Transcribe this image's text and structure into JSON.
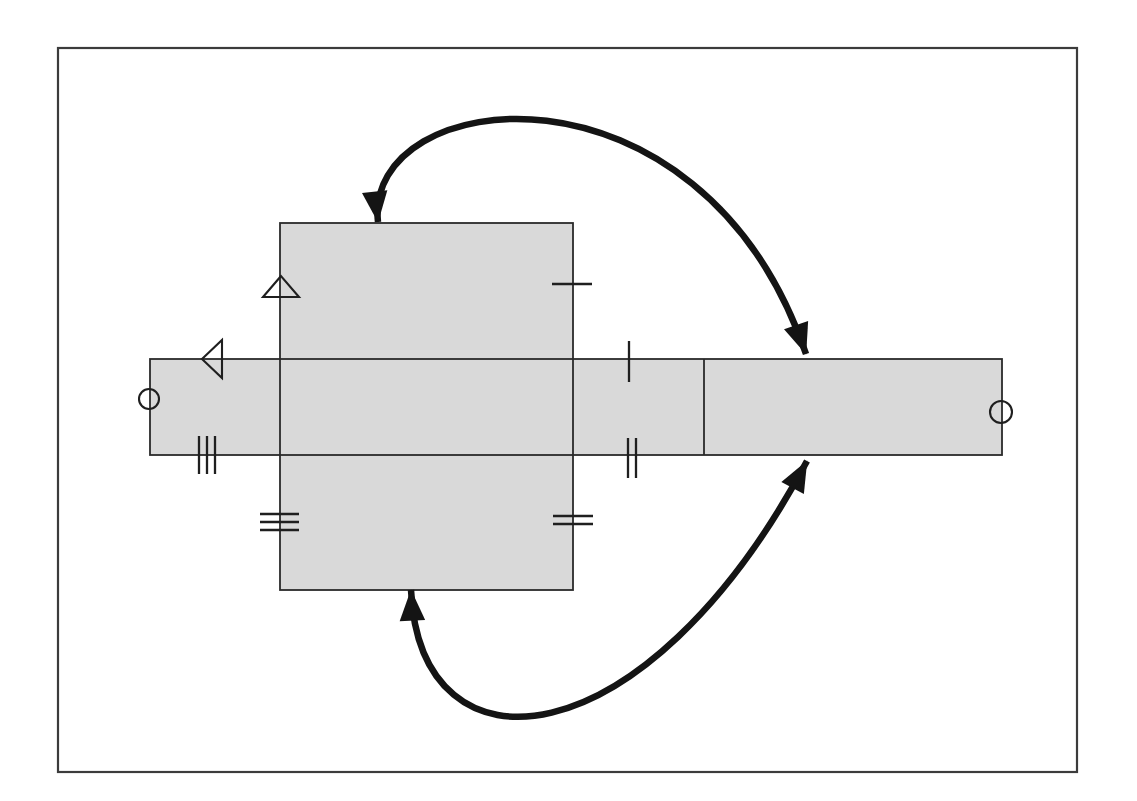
{
  "canvas": {
    "width": 1137,
    "height": 801,
    "background": "#ffffff"
  },
  "palette": {
    "frame_stroke": "#3c3c3c",
    "shape_fill": "#d9d9d9",
    "shape_stroke": "#2a2a2a",
    "mark_stroke": "#1f1f1f",
    "arrow_color": "#141414"
  },
  "frame": {
    "x": 58,
    "y": 48,
    "width": 1019,
    "height": 724,
    "stroke_width": 2.2
  },
  "net": {
    "strip": {
      "x": 150,
      "y": 359,
      "width": 852,
      "height": 96,
      "stroke_width": 1.8
    },
    "panel": {
      "x": 280,
      "y": 223,
      "width": 293,
      "height": 367,
      "stroke_width": 1.8
    },
    "divider": {
      "x1": 704,
      "y1": 359,
      "x2": 704,
      "y2": 455,
      "stroke_width": 1.8
    }
  },
  "tick_sets": [
    {
      "name": "single-tick-panel-right-edge",
      "lines": [
        {
          "x1": 552,
          "y1": 284,
          "x2": 592,
          "y2": 284
        }
      ]
    },
    {
      "name": "single-tick-strip-top-edge",
      "lines": [
        {
          "x1": 629,
          "y1": 341,
          "x2": 629,
          "y2": 382
        }
      ]
    },
    {
      "name": "double-tick-panel-right-edge",
      "lines": [
        {
          "x1": 553,
          "y1": 516,
          "x2": 593,
          "y2": 516
        },
        {
          "x1": 553,
          "y1": 524,
          "x2": 593,
          "y2": 524
        }
      ]
    },
    {
      "name": "double-tick-strip-bottom-edge",
      "lines": [
        {
          "x1": 628,
          "y1": 438,
          "x2": 628,
          "y2": 478
        },
        {
          "x1": 636,
          "y1": 438,
          "x2": 636,
          "y2": 478
        }
      ]
    },
    {
      "name": "triple-tick-panel-left-edge",
      "lines": [
        {
          "x1": 260,
          "y1": 514,
          "x2": 299,
          "y2": 514
        },
        {
          "x1": 260,
          "y1": 522,
          "x2": 299,
          "y2": 522
        },
        {
          "x1": 260,
          "y1": 530,
          "x2": 299,
          "y2": 530
        }
      ]
    },
    {
      "name": "triple-tick-strip-bottom-edge",
      "lines": [
        {
          "x1": 199,
          "y1": 436,
          "x2": 199,
          "y2": 474
        },
        {
          "x1": 207,
          "y1": 436,
          "x2": 207,
          "y2": 474
        },
        {
          "x1": 215,
          "y1": 436,
          "x2": 215,
          "y2": 474
        }
      ]
    }
  ],
  "triangle_marks": [
    {
      "name": "up-triangle-panel-left-edge",
      "points": "281,276 263,297 299,297"
    },
    {
      "name": "left-triangle-strip-top-edge",
      "points": "202,359 222,340 222,378"
    }
  ],
  "circle_marks": [
    {
      "name": "circle-strip-left-end",
      "cx": 149,
      "cy": 399,
      "r": 10
    },
    {
      "name": "circle-strip-right-end",
      "cx": 1001,
      "cy": 412,
      "r": 11
    }
  ],
  "fold_arrows": [
    {
      "name": "top-fold-arrow",
      "path": "M 378 222 C 363 85, 700 45, 806 354",
      "double_headed": true,
      "stroke_width": 6.5
    },
    {
      "name": "bottom-fold-arrow",
      "path": "M 411 590 C 420 785, 645 765, 807 461",
      "double_headed": true,
      "stroke_width": 6.5
    }
  ]
}
